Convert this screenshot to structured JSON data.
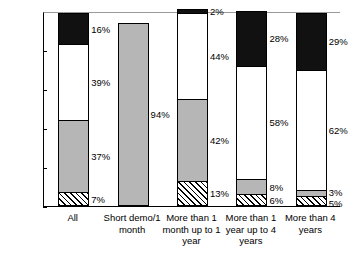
{
  "chart_data": {
    "type": "bar",
    "subtype": "stacked-bar-100-percent",
    "title": "",
    "xlabel": "",
    "ylabel": "",
    "ylim": [
      0,
      100
    ],
    "y_tick_labels": [
      "0%",
      "20%",
      "40%",
      "60%",
      "80%",
      "100%"
    ],
    "y_tick_values": [
      0,
      20,
      40,
      60,
      80,
      100
    ],
    "grid": false,
    "legend": "none",
    "categories": [
      "All",
      "Short demo/1 month",
      "More than 1 month up to 1 year",
      "More than 1 year up to 4 years",
      "More than 4 years"
    ],
    "series": [
      {
        "name": "hatched",
        "pattern": "diagonal-hatch",
        "color": "#ffffff",
        "values": [
          7,
          0,
          13,
          6,
          5
        ]
      },
      {
        "name": "gray",
        "pattern": "solid",
        "color": "#b6b6b6",
        "values": [
          37,
          94,
          42,
          8,
          3
        ]
      },
      {
        "name": "white",
        "pattern": "solid",
        "color": "#ffffff",
        "values": [
          39,
          0,
          44,
          58,
          62
        ]
      },
      {
        "name": "black",
        "pattern": "solid",
        "color": "#111111",
        "values": [
          16,
          0,
          2,
          28,
          29
        ]
      }
    ],
    "data_labels": [
      {
        "category": "All",
        "series": "hatched",
        "text": "7%",
        "value": 7,
        "side": "right"
      },
      {
        "category": "All",
        "series": "gray",
        "text": "37%",
        "value": 37,
        "side": "right"
      },
      {
        "category": "All",
        "series": "white",
        "text": "39%",
        "value": 39,
        "side": "right"
      },
      {
        "category": "All",
        "series": "black",
        "text": "16%",
        "value": 16,
        "side": "right"
      },
      {
        "category": "Short demo/1 month",
        "series": "gray",
        "text": "94%",
        "value": 94,
        "side": "right"
      },
      {
        "category": "More than 1 month up to 1 year",
        "series": "hatched",
        "text": "13%",
        "value": 13,
        "side": "right"
      },
      {
        "category": "More than 1 month up to 1 year",
        "series": "gray",
        "text": "42%",
        "value": 42,
        "side": "right"
      },
      {
        "category": "More than 1 month up to 1 year",
        "series": "white",
        "text": "44%",
        "value": 44,
        "side": "right"
      },
      {
        "category": "More than 1 month up to 1 year",
        "series": "black",
        "text": "2%",
        "value": 2,
        "side": "right"
      },
      {
        "category": "More than 1 year up to 4 years",
        "series": "hatched",
        "text": "6%",
        "value": 6,
        "side": "right"
      },
      {
        "category": "More than 1 year up to 4 years",
        "series": "gray",
        "text": "8%",
        "value": 8,
        "side": "right"
      },
      {
        "category": "More than 1 year up to 4 years",
        "series": "white",
        "text": "58%",
        "value": 58,
        "side": "right"
      },
      {
        "category": "More than 1 year up to 4 years",
        "series": "black",
        "text": "28%",
        "value": 28,
        "side": "right"
      },
      {
        "category": "More than 4 years",
        "series": "hatched",
        "text": "5%",
        "value": 5,
        "side": "right"
      },
      {
        "category": "More than 4 years",
        "series": "gray",
        "text": "3%",
        "value": 3,
        "side": "right"
      },
      {
        "category": "More than 4 years",
        "series": "white",
        "text": "62%",
        "value": 62,
        "side": "right"
      },
      {
        "category": "More than 4 years",
        "series": "black",
        "text": "29%",
        "value": 29,
        "side": "right"
      }
    ]
  },
  "axis": {
    "y_labels": [
      "100%",
      "80%",
      "60%",
      "40%",
      "20%",
      "0%"
    ]
  },
  "x_categories": [
    {
      "label": "All"
    },
    {
      "label": "Short demo/1 month"
    },
    {
      "label": "More than 1 month up to 1 year"
    },
    {
      "label": "More than 1 year up to 4 years"
    },
    {
      "label": "More than 4 years"
    }
  ]
}
